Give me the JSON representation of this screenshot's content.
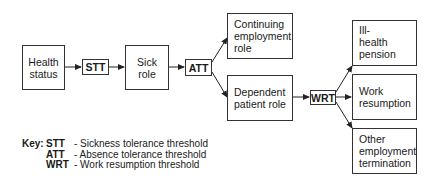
{
  "nodes": {
    "health_status": "Health status",
    "sick_role": "Sick role",
    "continuing_employment": "Continuing employment role",
    "dependent_patient": "Dependent patient role",
    "ill_health_pension": "Ill- health pension",
    "work_resumption": "Work resumption",
    "other_termination": "Other employment termination"
  },
  "thresholds": {
    "stt": "STT",
    "att": "ATT",
    "wrt": "WRT"
  },
  "key": {
    "label": "Key:",
    "items": [
      {
        "abbr": "STT",
        "desc": "- Sickness tolerance threshold"
      },
      {
        "abbr": "ATT",
        "desc": "- Absence tolerance threshold"
      },
      {
        "abbr": "WRT",
        "desc": "- Work resumption threshold"
      }
    ]
  }
}
